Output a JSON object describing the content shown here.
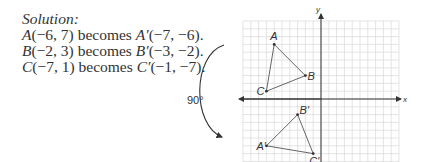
{
  "solution": {
    "heading": "Solution:",
    "lines": [
      {
        "pre": "A",
        "pre_coords": "(−6, 7) becomes ",
        "post": "A′",
        "post_coords": "(−7, −6)."
      },
      {
        "pre": "B",
        "pre_coords": "(−2, 3) becomes ",
        "post": "B′",
        "post_coords": "(−3, −2)."
      },
      {
        "pre": "C",
        "pre_coords": "(−7, 1) becomes ",
        "post": "C′",
        "post_coords": "(−1, −7)."
      }
    ]
  },
  "graph": {
    "x_axis_label": "x",
    "y_axis_label": "y",
    "rotation_label": "90°",
    "grid": {
      "xmin": -10,
      "xmax": 10,
      "ymin": -8,
      "ymax": 10
    },
    "original": {
      "A": {
        "label": "A",
        "x": -6,
        "y": 7
      },
      "B": {
        "label": "B",
        "x": -2,
        "y": 3
      },
      "C": {
        "label": "C",
        "x": -7,
        "y": 1
      }
    },
    "image": {
      "A": {
        "label": "A′",
        "x": -7,
        "y": -6
      },
      "B": {
        "label": "B′",
        "x": -3,
        "y": -2
      },
      "C": {
        "label": "C′",
        "x": -1,
        "y": -7
      }
    }
  }
}
